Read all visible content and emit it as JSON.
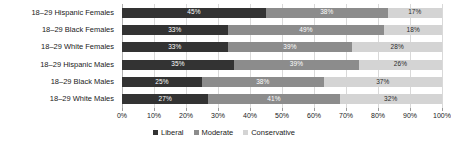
{
  "chart_data": {
    "type": "bar",
    "orientation": "horizontal",
    "stacked": true,
    "stacked_normalized": true,
    "title": "",
    "subtitle": "",
    "xlabel": "",
    "ylabel": "",
    "xlim": [
      0,
      100
    ],
    "grid": true,
    "legend_position": "bottom",
    "xticks": [
      "0%",
      "10%",
      "20%",
      "30%",
      "40%",
      "50%",
      "60%",
      "70%",
      "80%",
      "90%",
      "100%"
    ],
    "xtick_values": [
      0,
      10,
      20,
      30,
      40,
      50,
      60,
      70,
      80,
      90,
      100
    ],
    "categories": [
      "18–29 Hispanic Females",
      "18–29 Black Females",
      "18–29 White Females",
      "18–29 Hispanic Males",
      "18–29 Black Males",
      "18–29 White Males"
    ],
    "series": [
      {
        "name": "Liberal",
        "color": "#333333",
        "values": [
          45,
          33,
          33,
          35,
          25,
          27
        ],
        "labels": [
          "45%",
          "33%",
          "33%",
          "35%",
          "25%",
          "27%"
        ]
      },
      {
        "name": "Moderate",
        "color": "#8c8c8c",
        "values": [
          38,
          49,
          39,
          39,
          38,
          41
        ],
        "labels": [
          "38%",
          "49%",
          "39%",
          "39%",
          "38%",
          "41%"
        ]
      },
      {
        "name": "Conservative",
        "color": "#d4d4d4",
        "values": [
          17,
          18,
          28,
          26,
          37,
          32
        ],
        "labels": [
          "17%",
          "18%",
          "28%",
          "26%",
          "37%",
          "32%"
        ]
      }
    ],
    "legend": [
      {
        "label": "Liberal",
        "color": "#333333"
      },
      {
        "label": "Moderate",
        "color": "#8c8c8c"
      },
      {
        "label": "Conservative",
        "color": "#d4d4d4"
      }
    ]
  }
}
